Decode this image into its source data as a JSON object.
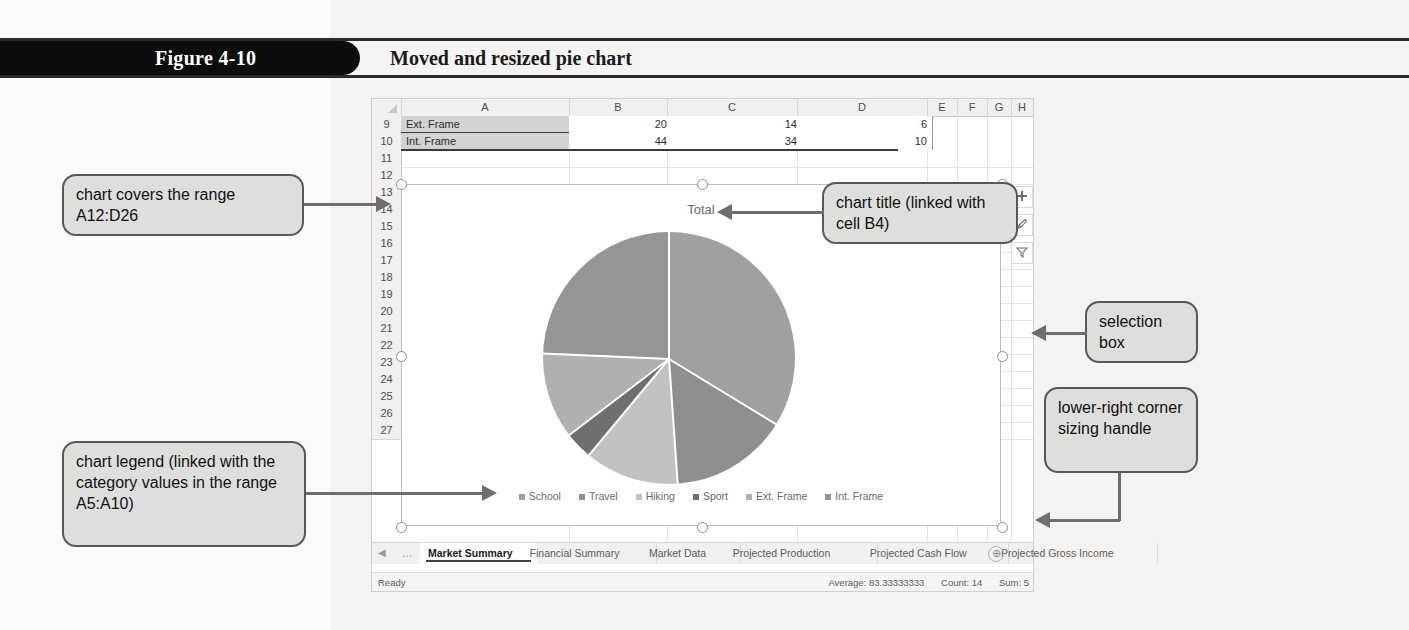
{
  "figure": {
    "tab_label": "Figure 4-10",
    "title": "Moved and resized pie chart"
  },
  "spreadsheet": {
    "column_headers": [
      "A",
      "B",
      "C",
      "D",
      "E",
      "F",
      "G",
      "H",
      "I"
    ],
    "row_numbers": [
      "9",
      "10",
      "11",
      "12",
      "13",
      "14",
      "15",
      "16",
      "17",
      "18",
      "19",
      "20",
      "21",
      "22",
      "23",
      "24",
      "25",
      "26",
      "27"
    ],
    "data_rows": [
      {
        "row": "9",
        "a": "Ext. Frame",
        "b": "20",
        "c": "14",
        "d": "6"
      },
      {
        "row": "10",
        "a": "Int. Frame",
        "b": "44",
        "c": "34",
        "d": "10"
      }
    ],
    "sheet_tabs": [
      {
        "label": "Market Summary",
        "active": true
      },
      {
        "label": "Financial Summary",
        "active": false
      },
      {
        "label": "Market Data",
        "active": false
      },
      {
        "label": "Projected Production",
        "active": false
      },
      {
        "label": "Projected Cash Flow",
        "active": false
      },
      {
        "label": "Projected Gross Income",
        "active": false
      }
    ],
    "tab_nav": {
      "prev": "◀",
      "ellipsis": "...",
      "add": "⊕"
    },
    "status": {
      "mode": "Ready",
      "average": "Average: 83.33333333",
      "count": "Count: 14",
      "sum": "Sum: 5"
    }
  },
  "chart": {
    "title": "Total",
    "side_buttons": [
      {
        "name": "chart-elements",
        "glyph": "+"
      },
      {
        "name": "chart-styles",
        "glyph": "brush"
      },
      {
        "name": "chart-filters",
        "glyph": "filter"
      }
    ]
  },
  "chart_data": {
    "type": "pie",
    "title": "Total",
    "categories": [
      "School",
      "Travel",
      "Hiking",
      "Sport",
      "Ext. Frame",
      "Int. Frame"
    ],
    "values": [
      122,
      55,
      44,
      13,
      40,
      88
    ],
    "colors": [
      "#a0a0a0",
      "#8f8f8f",
      "#c2c2c2",
      "#6f6f6f",
      "#b0b0b0",
      "#959595"
    ],
    "legend_position": "bottom",
    "grid": false,
    "xlabel": "",
    "ylabel": ""
  },
  "callouts": [
    {
      "id": "chart-range",
      "text": "chart covers the range A12:D26"
    },
    {
      "id": "chart-title",
      "text": "chart title (linked with cell B4)"
    },
    {
      "id": "selection-box",
      "text": "selection box"
    },
    {
      "id": "sizing-handle",
      "text": "lower-right corner sizing handle"
    },
    {
      "id": "chart-legend",
      "text": "chart legend (linked with the category values in the range A5:A10)"
    }
  ]
}
